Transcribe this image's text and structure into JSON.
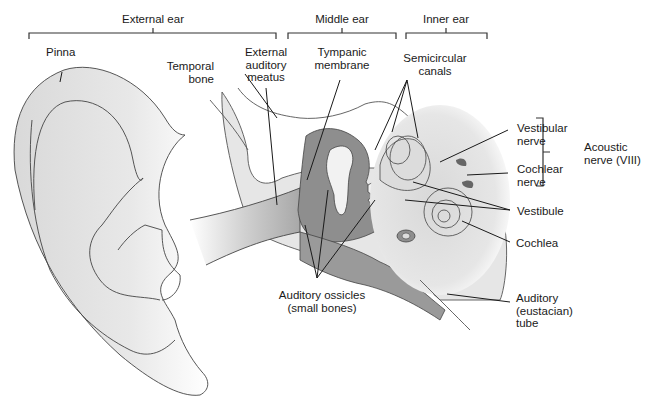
{
  "sections": {
    "external": "External ear",
    "middle": "Middle ear",
    "inner": "Inner ear"
  },
  "labels": {
    "pinna": "Pinna",
    "temporal_bone": "Temporal\nbone",
    "external_auditory_meatus": "External\nauditory\nmeatus",
    "tympanic_membrane": "Tympanic\nmembrane",
    "semicircular_canals": "Semicircular\ncanals",
    "vestibular_nerve": "Vestibular\nnerve",
    "cochlear_nerve": "Cochlear\nnerve",
    "acoustic_nerve": "Acoustic\nnerve (VIII)",
    "vestibule": "Vestibule",
    "cochlea": "Cochlea",
    "auditory_ossicles": "Auditory ossicles\n(small bones)",
    "auditory_tube": "Auditory\n(eustacian)\ntube"
  },
  "colors": {
    "tissue_light": "#e6e6e6",
    "tissue_mid": "#b4b4b4",
    "tissue_dark": "#8c8c8c",
    "line": "#2a2a2a"
  }
}
